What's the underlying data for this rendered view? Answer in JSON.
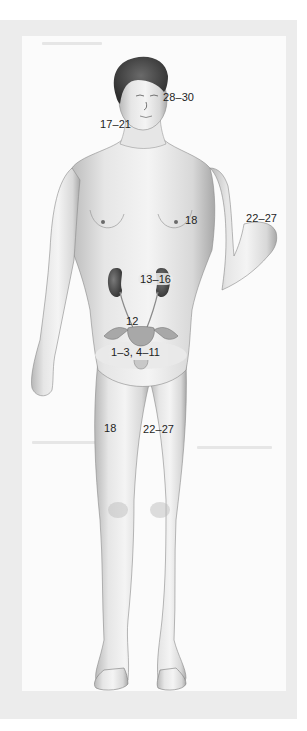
{
  "figure": {
    "colors": {
      "frame": "#ececec",
      "panel": "#fbfbfb",
      "skin_light": "#f2f2f2",
      "skin_mid": "#d4d4d4",
      "skin_shadow": "#9a9a9a",
      "hair": "#4a4a4a",
      "kidney": "#5a5a5a",
      "pelvic_highlight": "#e9e9e9",
      "label_text": "#1e1e1e"
    },
    "labels": [
      {
        "id": "head-right",
        "text": "28–30",
        "region": "face / head"
      },
      {
        "id": "neck-left",
        "text": "17–21",
        "region": "neck"
      },
      {
        "id": "upper-arm",
        "text": "18",
        "region": "upper arm"
      },
      {
        "id": "hand",
        "text": "22–27",
        "region": "hand"
      },
      {
        "id": "kidney",
        "text": "13–16",
        "region": "kidney"
      },
      {
        "id": "bladder",
        "text": "12",
        "region": "bladder / ureters"
      },
      {
        "id": "pelvis",
        "text": "1–3, 4–11",
        "region": "pelvis / reproductive organs"
      },
      {
        "id": "thigh-left",
        "text": "18",
        "region": "thigh"
      },
      {
        "id": "thigh-right",
        "text": "22–27",
        "region": "thigh"
      }
    ]
  }
}
